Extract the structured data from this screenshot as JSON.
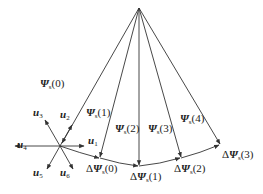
{
  "diagram": {
    "apex": {
      "x": 139,
      "y": 8
    },
    "origin": {
      "x": 60,
      "y": 146
    },
    "flux_vectors": [
      {
        "label": "Ψ",
        "sub": "s",
        "idx": "(0)",
        "lx": 40,
        "ly": 87
      },
      {
        "label": "Ψ",
        "sub": "s",
        "idx": "(1)",
        "lx": 86,
        "ly": 116
      },
      {
        "label": "Ψ",
        "sub": "s",
        "idx": "(2)",
        "lx": 115,
        "ly": 132
      },
      {
        "label": "Ψ",
        "sub": "s",
        "idx": "(3)",
        "lx": 148,
        "ly": 132
      },
      {
        "label": "Ψ",
        "sub": "s",
        "idx": "(4)",
        "lx": 180,
        "ly": 122
      }
    ],
    "delta_vectors": [
      {
        "label": "ΔΨ",
        "sub": "s",
        "idx": "(0)",
        "lx": 86,
        "ly": 172
      },
      {
        "label": "ΔΨ",
        "sub": "s",
        "idx": "(1)",
        "lx": 130,
        "ly": 180
      },
      {
        "label": "ΔΨ",
        "sub": "s",
        "idx": "(2)",
        "lx": 174,
        "ly": 172
      },
      {
        "label": "ΔΨ",
        "sub": "s",
        "idx": "(3)",
        "lx": 222,
        "ly": 158
      }
    ],
    "voltage_vectors": [
      {
        "label": "u",
        "sub": "1",
        "lx": 88,
        "ly": 144
      },
      {
        "label": "u",
        "sub": "2",
        "lx": 60,
        "ly": 118
      },
      {
        "label": "u",
        "sub": "3",
        "lx": 33,
        "ly": 116
      },
      {
        "label": "u",
        "sub": "4",
        "lx": 17,
        "ly": 148
      },
      {
        "label": "u",
        "sub": "5",
        "lx": 33,
        "ly": 176
      },
      {
        "label": "u",
        "sub": "6",
        "lx": 60,
        "ly": 176
      }
    ]
  }
}
